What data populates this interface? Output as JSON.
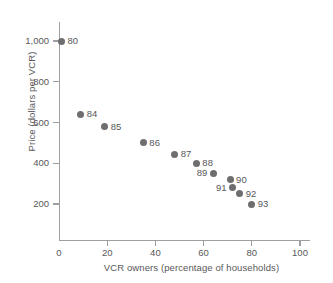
{
  "chart_data": {
    "type": "scatter",
    "title": "",
    "xlabel": "VCR owners (percentage of households)",
    "ylabel": "Price (dollars per VCR)",
    "xlim": [
      0,
      104
    ],
    "ylim": [
      0,
      1060
    ],
    "grid": false,
    "legend": "none",
    "xticks": [
      "0",
      "20",
      "40",
      "60",
      "80",
      "100"
    ],
    "xtick_values": [
      0,
      20,
      40,
      60,
      80,
      100
    ],
    "yticks": [
      "200",
      "400",
      "600",
      "800",
      "1,000"
    ],
    "ytick_values": [
      200,
      400,
      600,
      800,
      1000
    ],
    "point_color": "#6e6e70",
    "axis_color": "#9d9fa2",
    "text_color": "#58585a",
    "points": [
      {
        "label": "80",
        "x": 1,
        "y": 1000,
        "label_side": "right"
      },
      {
        "label": "84",
        "x": 9,
        "y": 640,
        "label_side": "right"
      },
      {
        "label": "85",
        "x": 19,
        "y": 580,
        "label_side": "right"
      },
      {
        "label": "86",
        "x": 35,
        "y": 500,
        "label_side": "right"
      },
      {
        "label": "87",
        "x": 48,
        "y": 445,
        "label_side": "right"
      },
      {
        "label": "88",
        "x": 57,
        "y": 400,
        "label_side": "right"
      },
      {
        "label": "89",
        "x": 64,
        "y": 350,
        "label_side": "left"
      },
      {
        "label": "90",
        "x": 71,
        "y": 320,
        "label_side": "right"
      },
      {
        "label": "91",
        "x": 72,
        "y": 280,
        "label_side": "left"
      },
      {
        "label": "92",
        "x": 75,
        "y": 250,
        "label_side": "right"
      },
      {
        "label": "93",
        "x": 80,
        "y": 200,
        "label_side": "right"
      }
    ]
  }
}
